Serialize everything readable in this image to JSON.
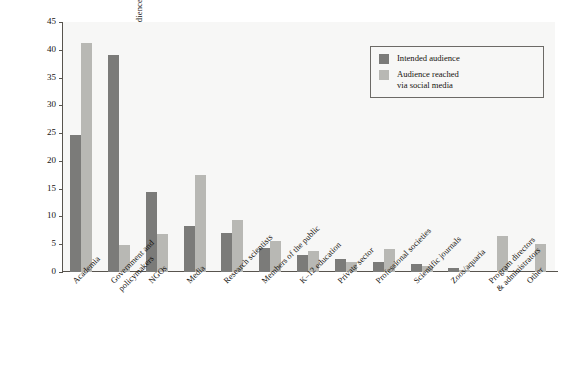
{
  "chart_data": {
    "type": "bar",
    "title": "",
    "xlabel": "",
    "ylabel": "Percentage of audience categories",
    "ylim": [
      0,
      45
    ],
    "yticks": [
      0,
      5,
      10,
      15,
      20,
      25,
      30,
      35,
      40,
      45
    ],
    "grid": false,
    "legend_position": "top-right",
    "categories": [
      "Academia",
      "Government and policymakers",
      "NGOs",
      "Media",
      "Research scientists",
      "Members of the public",
      "K–12 education",
      "Private sector",
      "Professional societies",
      "Scientific journals",
      "Zoos/aquaria",
      "Program directors & administrators",
      "Other"
    ],
    "category_lines": [
      [
        "Academia"
      ],
      [
        "Government and",
        "policymakers"
      ],
      [
        "NGOs"
      ],
      [
        "Media"
      ],
      [
        "Research scientists"
      ],
      [
        "Members of the public"
      ],
      [
        "K–12 education"
      ],
      [
        "Private sector"
      ],
      [
        "Professional societies"
      ],
      [
        "Scientific journals"
      ],
      [
        "Zoos/aquaria"
      ],
      [
        "Program directors",
        "& administrators"
      ],
      [
        "Other"
      ]
    ],
    "series": [
      {
        "name": "Intended audience",
        "color": "#7b7b79",
        "values": [
          24.7,
          39.1,
          14.4,
          8.2,
          7.1,
          4.4,
          3.1,
          2.4,
          1.8,
          1.5,
          0.7,
          0.0,
          0.0
        ]
      },
      {
        "name": "Audience reached via social media",
        "color": "#b8b8b4",
        "values": [
          41.3,
          4.8,
          6.8,
          17.5,
          9.3,
          5.6,
          3.8,
          1.8,
          4.2,
          1.0,
          0.3,
          6.5,
          5.0
        ]
      }
    ]
  },
  "legend": {
    "items": [
      {
        "label_lines": [
          "Intended audience"
        ],
        "color": "#7b7b79"
      },
      {
        "label_lines": [
          "Audience reached",
          "via social media"
        ],
        "color": "#b8b8b4"
      }
    ]
  },
  "axis": {
    "y_title": "Percentage of audience categories",
    "y_tick_labels": [
      "0",
      "5",
      "10",
      "15",
      "20",
      "25",
      "30",
      "35",
      "40",
      "45"
    ]
  },
  "colors": {
    "intended": "#7b7b79",
    "reached": "#b8b8b4",
    "plot_background": "#f7f7f6",
    "axis": "#58544e",
    "text": "#16130f"
  }
}
